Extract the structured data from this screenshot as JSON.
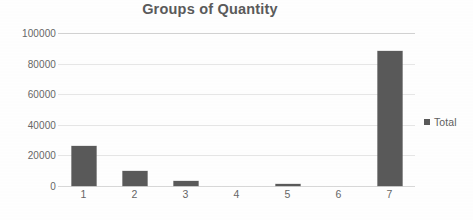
{
  "chart_data": {
    "type": "bar",
    "title": "Groups of Quantity",
    "xlabel": "",
    "ylabel": "",
    "categories": [
      "1",
      "2",
      "3",
      "4",
      "5",
      "6",
      "7"
    ],
    "series": [
      {
        "name": "Total",
        "values": [
          26000,
          10000,
          3300,
          0,
          1200,
          0,
          88000
        ]
      }
    ],
    "ylim": [
      0,
      100000
    ],
    "ytick_labels": [
      "0",
      "20000",
      "40000",
      "60000",
      "80000",
      "100000"
    ],
    "ytick_values": [
      0,
      20000,
      40000,
      60000,
      80000,
      100000
    ],
    "grid": true,
    "legend_position": "right",
    "legend_entries": [
      "Total"
    ],
    "bar_color": "#595959",
    "title_color": "#5A5A5A",
    "gridline_color": "#E6E6E6",
    "axis_text_color": "#666666"
  },
  "legend": {
    "label": "Total",
    "marker": "square-marker"
  }
}
